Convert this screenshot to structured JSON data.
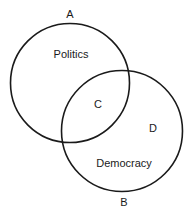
{
  "diagram": {
    "type": "venn",
    "sets": [
      {
        "id": "A",
        "label": "A",
        "name": "Politics"
      },
      {
        "id": "B",
        "label": "B",
        "name": "Democracy"
      }
    ],
    "regions": {
      "intersection": "C",
      "b_only": "D"
    },
    "colors": {
      "stroke": "#1a1a1a",
      "background": "#ffffff"
    }
  }
}
